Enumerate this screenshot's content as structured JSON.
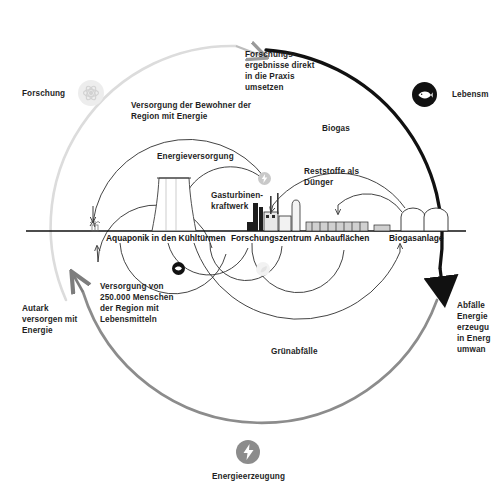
{
  "diagram": {
    "colors": {
      "outer_arc_black": "#111111",
      "outer_arc_gray": "#8c8c8c",
      "outer_arc_light": "#d9d9d9",
      "inner_arc": "#3a3a3a",
      "ground": "#111111",
      "text": "#1f1f1f",
      "badge_black": "#111111",
      "badge_gray": "#8c8c8c",
      "badge_faint": "#ededed"
    },
    "outer_labels": [
      {
        "id": "forschung",
        "text": "Forschung",
        "icon": "atom-icon"
      },
      {
        "id": "lebensmittel",
        "text": "Lebensm",
        "icon": "fish-icon"
      },
      {
        "id": "abfaelle",
        "text": "Abfälle\nEnergie\nerzeugu\nin Energ\numwan"
      },
      {
        "id": "energieerzeugung",
        "text": "Energieerzeugung",
        "icon": "lightning-icon"
      },
      {
        "id": "autark",
        "text": "Autark\nversorgen mit\nEnergie"
      }
    ],
    "flow_labels": [
      {
        "id": "forschungsergebnisse",
        "text": "Forschungs-\nergebnisse direkt\nin die Praxis\numsetzen"
      },
      {
        "id": "versorgung-bewohner",
        "text": "Versorgung der Bewohner der\nRegion mit Energie"
      },
      {
        "id": "energieversorgung",
        "text": "Energieversorgung"
      },
      {
        "id": "gasturbinen",
        "text": "Gasturbinen-\nkraftwerk"
      },
      {
        "id": "biogas",
        "text": "Biogas"
      },
      {
        "id": "reststoffe",
        "text": "Reststoffe als\nDünger"
      },
      {
        "id": "versorgung-menschen",
        "text": "Versorgung von\n250.000 Menschen\nder Region mit\nLebensmitteln"
      },
      {
        "id": "gruenabfaelle",
        "text": "Grünabfälle"
      }
    ],
    "ground_nodes": [
      {
        "id": "aquaponik",
        "text": "Aquaponik in den Kühltürmen"
      },
      {
        "id": "forschungszentrum",
        "text": "Forschungszentrum"
      },
      {
        "id": "anbauflaechen",
        "text": "Anbauflächen"
      },
      {
        "id": "biogasanlage",
        "text": "Biogasanlage"
      }
    ]
  }
}
